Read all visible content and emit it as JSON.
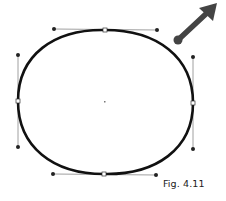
{
  "figure": {
    "caption": "Fig. 4.11",
    "colors": {
      "curve": "#111111",
      "handle_line": "#888888",
      "handle_point": "#222222",
      "anchor_fill": "#ffffff",
      "arrow": "#444444"
    },
    "ellipse": {
      "center": [
        105,
        102
      ],
      "anchors": [
        {
          "name": "top",
          "pos": [
            105,
            30
          ],
          "handles": [
            [
              54,
              29
            ],
            [
              157,
              30
            ]
          ]
        },
        {
          "name": "right",
          "pos": [
            193,
            103
          ],
          "handles": [
            [
              193,
              57
            ],
            [
              193,
              149
            ]
          ]
        },
        {
          "name": "bottom",
          "pos": [
            104,
            174
          ],
          "handles": [
            [
              156,
              175
            ],
            [
              53,
              174
            ]
          ]
        },
        {
          "name": "left",
          "pos": [
            18,
            101
          ],
          "handles": [
            [
              18,
              147
            ],
            [
              18,
              55
            ]
          ]
        }
      ]
    },
    "arrow": {
      "tail": [
        178,
        40
      ],
      "tip": [
        217,
        4
      ]
    }
  }
}
